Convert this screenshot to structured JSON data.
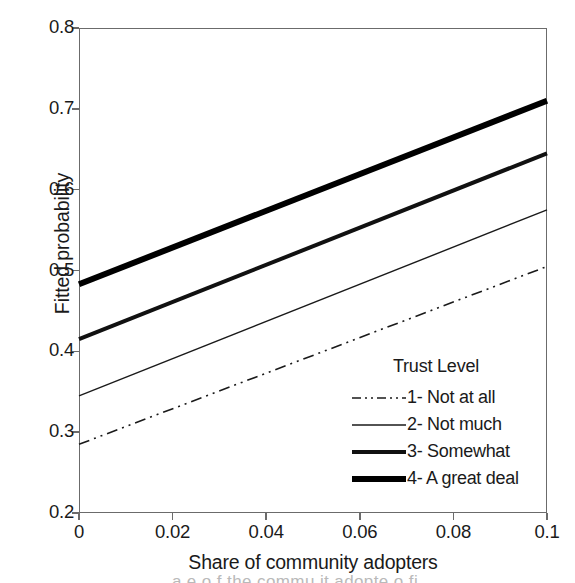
{
  "chart_data": {
    "type": "line",
    "title": "",
    "xlabel": "Share of community adopters",
    "ylabel": "Fitted probability",
    "xlim": [
      0,
      0.1
    ],
    "ylim": [
      0.2,
      0.8
    ],
    "xticks": [
      "0",
      "0.02",
      "0.04",
      "0.06",
      "0.08",
      "0.1"
    ],
    "xtick_values": [
      0,
      0.02,
      0.04,
      0.06,
      0.08,
      0.1
    ],
    "yticks": [
      "0.2",
      "0.3",
      "0.4",
      "0.5",
      "0.6",
      "0.7",
      "0.8"
    ],
    "ytick_values": [
      0.2,
      0.3,
      0.4,
      0.5,
      0.6,
      0.7,
      0.8
    ],
    "grid": false,
    "legend_position": "inside lower-right",
    "legend_title": "Trust Level",
    "x": [
      0,
      0.1
    ],
    "series": [
      {
        "name": "1- Not at all",
        "style": "dash-dot",
        "width": 1.6,
        "color": "#1a1a1a",
        "values": [
          0.285,
          0.505
        ]
      },
      {
        "name": "2- Not much",
        "style": "solid",
        "width": 1.4,
        "color": "#1a1a1a",
        "values": [
          0.345,
          0.575
        ]
      },
      {
        "name": "3- Somewhat",
        "style": "solid",
        "width": 4.0,
        "color": "#111111",
        "values": [
          0.415,
          0.645
        ]
      },
      {
        "name": "4- A great deal",
        "style": "solid",
        "width": 6.0,
        "color": "#000000",
        "values": [
          0.483,
          0.71
        ]
      }
    ]
  },
  "axes": {
    "frame_color": "#6b6b6b"
  },
  "caption": {
    "cut_text": "a    e  o    f  the  commu  it   adopte     o    fi"
  }
}
